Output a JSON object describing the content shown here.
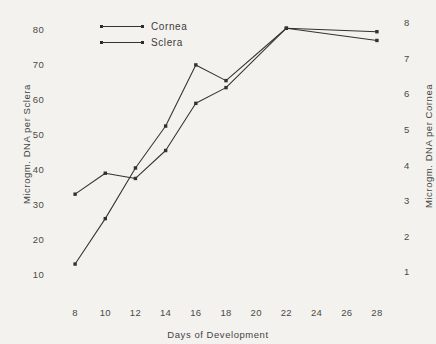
{
  "chart_data": {
    "type": "line",
    "title": "",
    "xlabel": "Days of Development",
    "ylabel": "Microgm. DNA per Sclera",
    "ylabel_right": "Microgm. DNA per Cornea",
    "x": [
      8,
      10,
      12,
      14,
      16,
      18,
      22,
      28
    ],
    "xlim": [
      7,
      29
    ],
    "ylim": [
      5,
      84
    ],
    "ylim_right": [
      0.45,
      8.2
    ],
    "xticks": [
      "8",
      "10",
      "12",
      "14",
      "16",
      "18",
      "20",
      "22",
      "24",
      "26",
      "28"
    ],
    "xtick_values": [
      8,
      10,
      12,
      14,
      16,
      18,
      20,
      22,
      24,
      26,
      28
    ],
    "yticks_left": [
      "10",
      "20",
      "30",
      "40",
      "50",
      "60",
      "70",
      "80"
    ],
    "ytick_values_left": [
      10,
      20,
      30,
      40,
      50,
      60,
      70,
      80
    ],
    "yticks_right": [
      "1",
      "2",
      "3",
      "4",
      "5",
      "6",
      "7",
      "8"
    ],
    "ytick_values_right": [
      1,
      2,
      3,
      4,
      5,
      6,
      7,
      8
    ],
    "grid": false,
    "legend_position": "upper left",
    "series": [
      {
        "name": "Cornea",
        "axis": "right",
        "values_left_scale": [
          33,
          39,
          37.5,
          45.5,
          59,
          63.5,
          80.5,
          77
        ],
        "values": [
          3.3,
          3.9,
          3.75,
          4.55,
          5.9,
          6.35,
          8.05,
          7.7
        ]
      },
      {
        "name": "Sclera",
        "axis": "left",
        "values": [
          13,
          26,
          40.5,
          52.5,
          70,
          65.5,
          80.5,
          79.5
        ]
      }
    ],
    "legend": [
      "Cornea",
      "Sclera"
    ],
    "ink_color": "#33322e",
    "background_color": "#f4f2ef"
  }
}
